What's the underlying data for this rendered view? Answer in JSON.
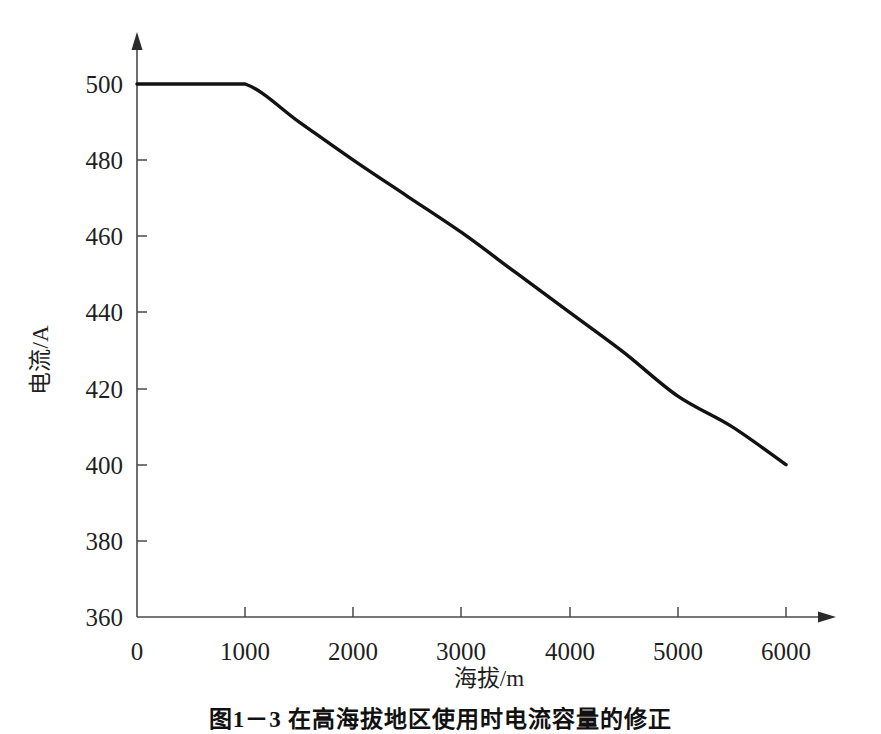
{
  "chart_data": {
    "type": "line",
    "title": "",
    "xlabel": "海拔/m",
    "ylabel": "电流/A",
    "xlim": [
      0,
      6000
    ],
    "ylim": [
      360,
      500
    ],
    "xticks": [
      "0",
      "1000",
      "2000",
      "3000",
      "4000",
      "5000",
      "6000"
    ],
    "xtick_values": [
      0,
      1000,
      2000,
      3000,
      4000,
      5000,
      6000
    ],
    "yticks": [
      "360",
      "380",
      "400",
      "420",
      "440",
      "460",
      "480",
      "500"
    ],
    "ytick_values": [
      360,
      380,
      400,
      420,
      440,
      460,
      480,
      500
    ],
    "grid": false,
    "legend": null,
    "series": [
      {
        "name": "额定电流",
        "x": [
          0,
          500,
          1000,
          1500,
          2000,
          2500,
          3000,
          3500,
          4000,
          4500,
          5000,
          5500,
          6000
        ],
        "values": [
          500,
          500,
          500,
          490,
          480,
          470.5,
          461,
          450.5,
          440,
          429.5,
          418,
          410,
          400
        ]
      }
    ],
    "annotations": [],
    "colors": {
      "curve": "#121212",
      "axis": "#4a4a4a",
      "text": "#1f1f1f"
    }
  },
  "figure": {
    "caption": "图1－3  在高海拔地区使用时电流容量的修正"
  },
  "axes": {
    "y_title": "电流/A",
    "x_title": "海拔/m"
  }
}
